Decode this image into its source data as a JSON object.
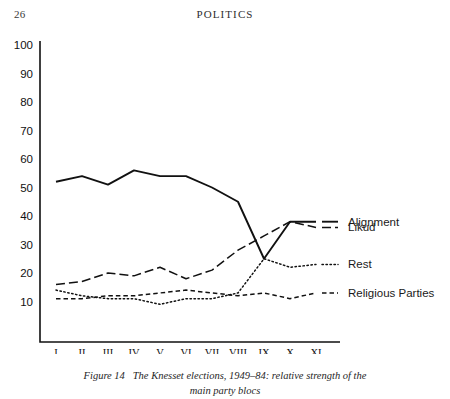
{
  "page": {
    "folio": "26",
    "running_head": "POLITICS"
  },
  "caption": {
    "figure_number": "Figure 14",
    "line1": "The Knesset elections, 1949–84: relative strength of the",
    "line2": "main party blocs"
  },
  "legend": {
    "position": "right",
    "entries": [
      {
        "label": "Alignment",
        "style": "solid"
      },
      {
        "label": "Likud",
        "style": "long-dash"
      },
      {
        "label": "Rest",
        "style": "dotted"
      },
      {
        "label": "Religious Parties",
        "style": "short-dash"
      }
    ]
  },
  "chart_data": {
    "type": "line",
    "title": "The Knesset elections, 1949–84: relative strength of the main party blocs",
    "xlabel": "",
    "ylabel": "",
    "ylim": [
      0,
      100
    ],
    "yticks": [
      10,
      20,
      30,
      40,
      50,
      60,
      70,
      80,
      90,
      100
    ],
    "grid": false,
    "x": [
      "I",
      "II",
      "III",
      "IV",
      "V",
      "VI",
      "VII",
      "VIII",
      "IX",
      "X",
      "XI"
    ],
    "categories": [
      "1949",
      "1951",
      "1955",
      "1959",
      "1961",
      "1965",
      "1969",
      "1973",
      "1977",
      "1981",
      "1984"
    ],
    "series": [
      {
        "name": "Alignment",
        "style": "solid",
        "values": [
          52,
          54,
          51,
          56,
          54,
          54,
          50,
          45,
          25,
          38,
          38
        ]
      },
      {
        "name": "Likud",
        "style": "long-dash",
        "values": [
          16,
          17,
          20,
          19,
          22,
          18,
          21,
          28,
          33,
          38,
          36
        ]
      },
      {
        "name": "Rest",
        "style": "dotted",
        "values": [
          14,
          12,
          11,
          11,
          9,
          11,
          11,
          13,
          25,
          22,
          23
        ]
      },
      {
        "name": "Religious Parties",
        "style": "short-dash",
        "values": [
          11,
          11,
          12,
          12,
          13,
          14,
          13,
          12,
          13,
          11,
          13
        ]
      }
    ]
  }
}
